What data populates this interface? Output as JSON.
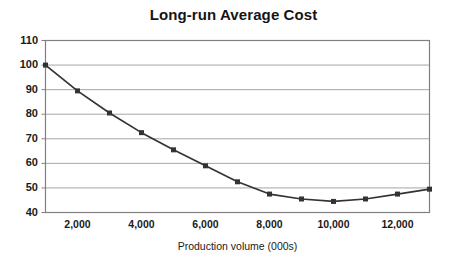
{
  "chart_data": {
    "type": "line",
    "title": "Long-run Average Cost",
    "xlabel": "Production volume (000s)",
    "ylabel": "",
    "x": [
      1000,
      2000,
      3000,
      4000,
      5000,
      6000,
      7000,
      8000,
      9000,
      10000,
      11000,
      12000,
      13000
    ],
    "values": [
      100,
      89.5,
      80.5,
      72.5,
      65.5,
      59,
      52.5,
      47.5,
      45.5,
      44.5,
      45.5,
      47.5,
      49.5
    ],
    "xlim": [
      1000,
      13000
    ],
    "ylim": [
      40,
      110
    ],
    "x_ticks": [
      2000,
      4000,
      6000,
      8000,
      10000,
      12000
    ],
    "x_tick_labels": [
      "2,000",
      "4,000",
      "6,000",
      "8,000",
      "10,000",
      "12,000"
    ],
    "y_ticks": [
      40,
      50,
      60,
      70,
      80,
      90,
      100,
      110
    ],
    "y_tick_labels": [
      "40",
      "50",
      "60",
      "70",
      "80",
      "90",
      "100",
      "110"
    ],
    "grid": "horizontal",
    "legend": "none",
    "marker": "square",
    "series_color": "#333333",
    "grid_color": "#a6a6a6",
    "frame_color": "#808080",
    "background": "#ffffff"
  },
  "axis": {
    "title_text": "Long-run Average Cost",
    "x_title_text": "Production volume (000s)"
  }
}
